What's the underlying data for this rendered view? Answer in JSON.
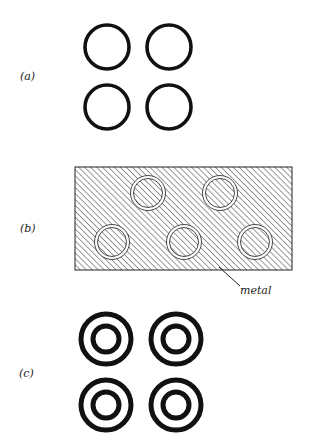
{
  "figure": {
    "panels": [
      {
        "label": "(a)",
        "description": "four single thick rings",
        "rings": [
          {
            "cx": 107,
            "cy": 47,
            "r": 22
          },
          {
            "cx": 169,
            "cy": 47,
            "r": 22
          },
          {
            "cx": 107,
            "cy": 107,
            "r": 22
          },
          {
            "cx": 169,
            "cy": 107,
            "r": 22
          }
        ]
      },
      {
        "label": "(b)",
        "description": "hatched metal plate with five circular apertures",
        "annotation": "metal",
        "plate": {
          "x": 75,
          "y": 167,
          "width": 217,
          "height": 103
        },
        "apertures": [
          {
            "cx": 148,
            "cy": 193,
            "r": 16
          },
          {
            "cx": 220,
            "cy": 193,
            "r": 16
          },
          {
            "cx": 112,
            "cy": 242,
            "r": 16
          },
          {
            "cx": 184,
            "cy": 242,
            "r": 16
          },
          {
            "cx": 255,
            "cy": 242,
            "r": 16
          }
        ]
      },
      {
        "label": "(c)",
        "description": "four concentric double rings",
        "rings": [
          {
            "cx": 106,
            "cy": 339
          },
          {
            "cx": 176,
            "cy": 339
          },
          {
            "cx": 106,
            "cy": 405
          },
          {
            "cx": 176,
            "cy": 405
          }
        ]
      }
    ],
    "colors": {
      "stroke": "#111111",
      "hatch": "#333333",
      "background": "#ffffff"
    }
  }
}
